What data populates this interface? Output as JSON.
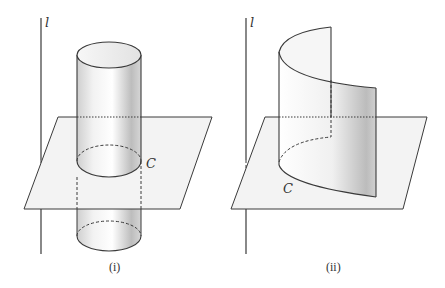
{
  "figure": {
    "panels": [
      {
        "id": "i",
        "caption": "(i)",
        "axis_label": "l",
        "curve_label": "C",
        "description": "Right circular cylinder with rulings parallel to line l intersecting a horizontal plane in closed curve C"
      },
      {
        "id": "ii",
        "caption": "(ii)",
        "axis_label": "l",
        "curve_label": "C",
        "description": "Curved surface (parabolic-like sheet) with rulings parallel to line l intersecting a horizontal plane in curve C"
      }
    ],
    "colors": {
      "line": "#3a3a3a",
      "plane_fill": "#f3f3f3",
      "surface_light": "#fafafa",
      "surface_dark": "#c8c8c8"
    }
  }
}
